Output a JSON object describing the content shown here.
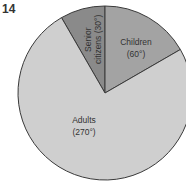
{
  "question_number": "14",
  "chart_data": {
    "type": "pie",
    "title": "",
    "unit": "degrees",
    "start_angle_deg": -30,
    "direction": "clockwise",
    "slices": [
      {
        "label": "Senior citizens",
        "value": 30,
        "value_label": "(30°)",
        "color": "#8a8a8a"
      },
      {
        "label": "Children",
        "value": 60,
        "value_label": "(60°)",
        "color": "#a3a3a3"
      },
      {
        "label": "Adults",
        "value": 270,
        "value_label": "(270°)",
        "color": "#cfcfcf"
      }
    ]
  },
  "labels": {
    "senior_line1": "Senior",
    "senior_line2": "citizens (30°)",
    "children_name": "Children",
    "children_value": "(60°)",
    "adults_name": "Adults",
    "adults_value": "(270°)"
  }
}
